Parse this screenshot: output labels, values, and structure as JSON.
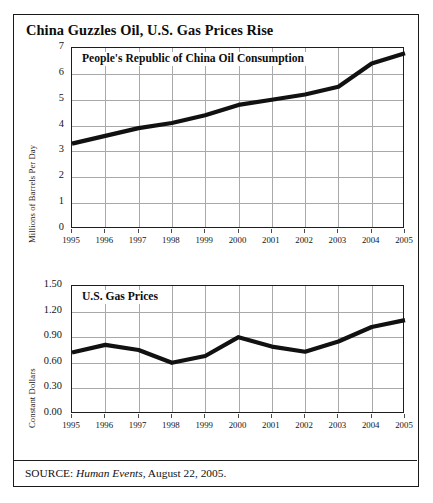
{
  "figure": {
    "title": "China Guzzles Oil, U.S. Gas Prices Rise",
    "source_prefix": "SOURCE:",
    "source_publication": "Human Events",
    "source_rest": ", August 22, 2005."
  },
  "chart_data": [
    {
      "type": "line",
      "title": "People's Republic of China Oil Consumption",
      "xlabel": "",
      "ylabel": "Millions of Barrels Per Day",
      "x": [
        1995,
        1996,
        1997,
        1998,
        1999,
        2000,
        2001,
        2002,
        2003,
        2004,
        2005
      ],
      "categories": [
        "1995",
        "1996",
        "1997",
        "1998",
        "1999",
        "2000",
        "2001",
        "2002",
        "2003",
        "2004",
        "2005"
      ],
      "values": [
        3.3,
        3.6,
        3.9,
        4.1,
        4.4,
        4.8,
        5.0,
        5.2,
        5.5,
        6.4,
        6.8
      ],
      "ylim": [
        0,
        7
      ],
      "yticks": [
        0,
        1,
        2,
        3,
        4,
        5,
        6,
        7
      ],
      "ytick_labels": [
        "0",
        "1",
        "2",
        "3",
        "4",
        "5",
        "6",
        "7"
      ],
      "xlim": [
        1995,
        2005
      ],
      "grid": true,
      "legend": "none",
      "line_color": "#111111"
    },
    {
      "type": "line",
      "title": "U.S. Gas Prices",
      "xlabel": "",
      "ylabel": "Constant Dollars",
      "x": [
        1995,
        1996,
        1997,
        1998,
        1999,
        2000,
        2001,
        2002,
        2003,
        2004,
        2005
      ],
      "categories": [
        "1995",
        "1996",
        "1997",
        "1998",
        "1999",
        "2000",
        "2001",
        "2002",
        "2003",
        "2004",
        "2005"
      ],
      "values": [
        0.72,
        0.81,
        0.75,
        0.6,
        0.68,
        0.9,
        0.79,
        0.73,
        0.85,
        1.02,
        1.1
      ],
      "ylim": [
        0.0,
        1.5
      ],
      "yticks": [
        0.0,
        0.3,
        0.6,
        0.9,
        1.2,
        1.5
      ],
      "ytick_labels": [
        "0.00",
        "0.30",
        "0.60",
        "0.90",
        "1.20",
        "1.50"
      ],
      "xlim": [
        1995,
        2005
      ],
      "grid": true,
      "legend": "none",
      "line_color": "#111111"
    }
  ]
}
